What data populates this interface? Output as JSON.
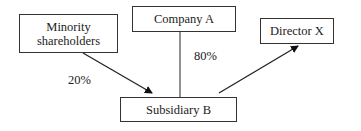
{
  "nodes": {
    "minority": {
      "label_line1": "Minority",
      "label_line2": "shareholders"
    },
    "company_a": {
      "label": "Company A"
    },
    "director_x": {
      "label": "Director X"
    },
    "subsidiary_b": {
      "label": "Subsidiary B"
    }
  },
  "edges": {
    "minority_to_subsidiary": {
      "label": "20%"
    },
    "company_a_to_subsidiary": {
      "label": "80%"
    },
    "subsidiary_to_director": {
      "label": ""
    }
  }
}
